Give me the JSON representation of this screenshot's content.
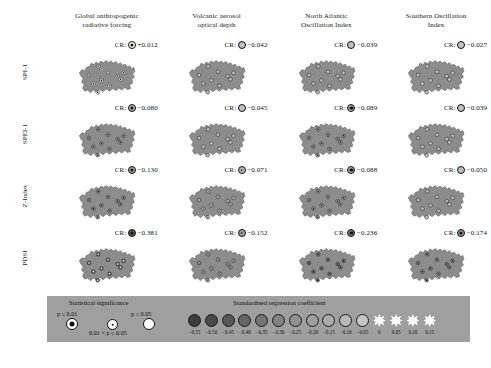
{
  "figure": {
    "region_name": "Czech Republic",
    "columns": [
      {
        "id": "garf",
        "line1": "Global anthropogenic",
        "line2": "radiative forcing"
      },
      {
        "id": "vaod",
        "line1": "Volcanic aerosol",
        "line2": "optical depth"
      },
      {
        "id": "naoi",
        "line1": "North Atlantic",
        "line2": "Oscillation Index"
      },
      {
        "id": "soi",
        "line1": "Southern Oscillation",
        "line2": "Index"
      }
    ],
    "rows": [
      {
        "id": "spi1",
        "label": "SPI-1"
      },
      {
        "id": "spei1",
        "label": "SPEI-1"
      },
      {
        "id": "zindex",
        "label": "Z-Index"
      },
      {
        "id": "pdsi",
        "label": "PDSI"
      }
    ],
    "cr_prefix": "CR:"
  },
  "chart_data": {
    "type": "heatmap",
    "title": "",
    "xlabel": "",
    "ylabel": "",
    "row_categories": [
      "SPI-1",
      "SPEI-1",
      "Z-Index",
      "PDSI"
    ],
    "column_categories": [
      "Global anthropogenic radiative forcing",
      "Volcanic aerosol optical depth",
      "North Atlantic Oscillation Index",
      "Southern Oscillation Index"
    ],
    "value_label": "Standardised regression coefficient",
    "panels": [
      {
        "row": "SPI-1",
        "column": "Global anthropogenic radiative forcing",
        "cr_value": "+0.012",
        "cr_numeric": 0.012,
        "significance": "p<=0.01"
      },
      {
        "row": "SPI-1",
        "column": "Volcanic aerosol optical depth",
        "cr_value": "-0.042",
        "cr_numeric": -0.042,
        "significance": "ns"
      },
      {
        "row": "SPI-1",
        "column": "North Atlantic Oscillation Index",
        "cr_value": "-0.039",
        "cr_numeric": -0.039,
        "significance": "ns"
      },
      {
        "row": "SPI-1",
        "column": "Southern Oscillation Index",
        "cr_value": "-0.027",
        "cr_numeric": -0.027,
        "significance": "ns"
      },
      {
        "row": "SPEI-1",
        "column": "Global anthropogenic radiative forcing",
        "cr_value": "-0.080",
        "cr_numeric": -0.08,
        "significance": "p<=0.01"
      },
      {
        "row": "SPEI-1",
        "column": "Volcanic aerosol optical depth",
        "cr_value": "-0.045",
        "cr_numeric": -0.045,
        "significance": "ns"
      },
      {
        "row": "SPEI-1",
        "column": "North Atlantic Oscillation Index",
        "cr_value": "-0.089",
        "cr_numeric": -0.089,
        "significance": "p<=0.01"
      },
      {
        "row": "SPEI-1",
        "column": "Southern Oscillation Index",
        "cr_value": "-0.039",
        "cr_numeric": -0.039,
        "significance": "ns"
      },
      {
        "row": "Z-Index",
        "column": "Global anthropogenic radiative forcing",
        "cr_value": "-0.130",
        "cr_numeric": -0.13,
        "significance": "p<=0.01"
      },
      {
        "row": "Z-Index",
        "column": "Volcanic aerosol optical depth",
        "cr_value": "-0.071",
        "cr_numeric": -0.071,
        "significance": "p<=0.05"
      },
      {
        "row": "Z-Index",
        "column": "North Atlantic Oscillation Index",
        "cr_value": "-0.088",
        "cr_numeric": -0.088,
        "significance": "p<=0.01"
      },
      {
        "row": "Z-Index",
        "column": "Southern Oscillation Index",
        "cr_value": "-0.050",
        "cr_numeric": -0.05,
        "significance": "ns"
      },
      {
        "row": "PDSI",
        "column": "Global anthropogenic radiative forcing",
        "cr_value": "-0.381",
        "cr_numeric": -0.381,
        "significance": "p<=0.01"
      },
      {
        "row": "PDSI",
        "column": "Volcanic aerosol optical depth",
        "cr_value": "-0.152",
        "cr_numeric": -0.152,
        "significance": "p<=0.05"
      },
      {
        "row": "PDSI",
        "column": "North Atlantic Oscillation Index",
        "cr_value": "-0.236",
        "cr_numeric": -0.236,
        "significance": "p<=0.01"
      },
      {
        "row": "PDSI",
        "column": "Southern Oscillation Index",
        "cr_value": "-0.174",
        "cr_numeric": -0.174,
        "significance": "p<=0.01"
      }
    ],
    "station_markers": {
      "count_per_panel": 10,
      "positions": [
        {
          "x": 22,
          "y": 50
        },
        {
          "x": 39,
          "y": 34
        },
        {
          "x": 30,
          "y": 66
        },
        {
          "x": 45,
          "y": 60
        },
        {
          "x": 38,
          "y": 82
        },
        {
          "x": 57,
          "y": 44
        },
        {
          "x": 60,
          "y": 70
        },
        {
          "x": 75,
          "y": 52
        },
        {
          "x": 80,
          "y": 58
        },
        {
          "x": 86,
          "y": 46
        }
      ]
    },
    "legend": {
      "significance_title": "Statistical significance",
      "significance_items": [
        {
          "label": "p ≤ 0.01",
          "symbol": "filled-ring"
        },
        {
          "label": "0.01 < p ≤ 0.05",
          "symbol": "small-dot"
        },
        {
          "label": "p ≤ 0.05",
          "symbol": "open-circle"
        }
      ],
      "coefficient_title": "Standardised regression coefficient",
      "ticks": [
        "-0.55",
        "-0.50",
        "-0.45",
        "-0.40",
        "-0.35",
        "-0.30",
        "-0.25",
        "-0.20",
        "-0.15",
        "-0.10",
        "-0.05",
        "0",
        "0.05",
        "0.10",
        "0.15"
      ],
      "swatch_colors": [
        "#3c3c3c",
        "#4a4a4a",
        "#585858",
        "#666666",
        "#747474",
        "#828282",
        "#909090",
        "#9e9e9e",
        "#ababab",
        "#b8b8b8",
        "#c5c5c5",
        "#ffffff",
        "#ffffff",
        "#ffffff",
        "#ffffff"
      ],
      "swatch_shapes": [
        "circle",
        "circle",
        "circle",
        "circle",
        "circle",
        "circle",
        "circle",
        "circle",
        "circle",
        "circle",
        "circle",
        "star",
        "star",
        "star",
        "star"
      ]
    },
    "colors": {
      "map_fill": "#8c8c8c",
      "map_outline": "#5d5d5d",
      "legend_background": "#9f9f9f",
      "page_background": "#ffffff",
      "text": "#111111"
    }
  }
}
